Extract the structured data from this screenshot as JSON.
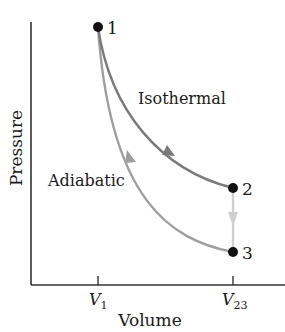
{
  "diagram": {
    "type": "pv-diagram",
    "axes": {
      "x_label": "Volume",
      "y_label": "Pressure",
      "ticks": [
        {
          "base": "V",
          "sub": "1"
        },
        {
          "base": "V",
          "sub": "23"
        }
      ]
    },
    "points": [
      {
        "id": "1",
        "label": "1"
      },
      {
        "id": "2",
        "label": "2"
      },
      {
        "id": "3",
        "label": "3"
      }
    ],
    "processes": [
      {
        "from": "1",
        "to": "2",
        "label": "Isothermal",
        "color": "#7a7a7a"
      },
      {
        "from": "2",
        "to": "3",
        "label": "",
        "color": "#cfcfcf"
      },
      {
        "from": "3",
        "to": "1",
        "label": "Adiabatic",
        "color": "#9e9e9e"
      }
    ],
    "colors": {
      "axis": "#333333",
      "point": "#111111",
      "isothermal": "#7a7a7a",
      "isochoric": "#cfcfcf",
      "adiabatic": "#9e9e9e"
    }
  }
}
